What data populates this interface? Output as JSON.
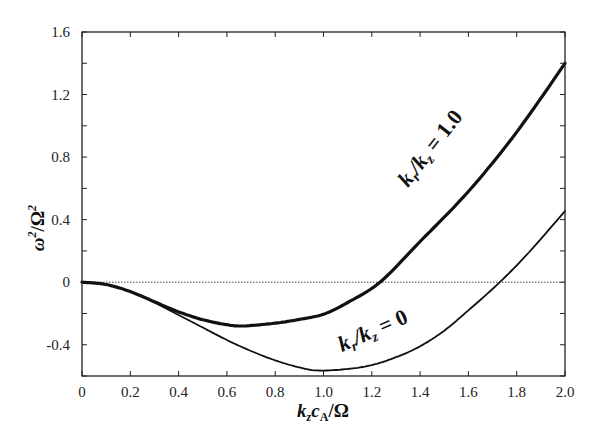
{
  "chart_data": {
    "type": "line",
    "title": "",
    "xlabel": "k_z c_A / Ω",
    "ylabel": "ω² / Ω²",
    "xlim": [
      0,
      2.0
    ],
    "ylim": [
      -0.6,
      1.6
    ],
    "grid": false,
    "legend": "none (inline curve labels)",
    "x_ticks": [
      "0",
      "0.2",
      "0.4",
      "0.6",
      "0.8",
      "1.0",
      "1.2",
      "1.4",
      "1.6",
      "1.8",
      "2.0"
    ],
    "y_ticks": [
      "-0.4",
      "0",
      "0.4",
      "0.8",
      "1.2",
      "1.6"
    ],
    "reference_line": {
      "y": 0,
      "style": "dotted"
    },
    "series": [
      {
        "name": "k_r/k_z = 1.0",
        "style": "thick",
        "x": [
          0,
          0.1,
          0.2,
          0.3,
          0.4,
          0.5,
          0.6,
          0.67,
          0.8,
          0.9,
          1.0,
          1.1,
          1.234,
          1.4,
          1.6,
          1.8,
          2.0
        ],
        "y": [
          0,
          -0.015,
          -0.06,
          -0.125,
          -0.19,
          -0.24,
          -0.272,
          -0.28,
          -0.262,
          -0.238,
          -0.205,
          -0.13,
          0,
          0.26,
          0.58,
          0.96,
          1.4
        ]
      },
      {
        "name": "k_r/k_z = 0",
        "style": "thin",
        "x": [
          0,
          0.1,
          0.2,
          0.3,
          0.4,
          0.5,
          0.6,
          0.7,
          0.8,
          0.9,
          0.98,
          1.1,
          1.2,
          1.3,
          1.4,
          1.5,
          1.6,
          1.73,
          1.85,
          2.0
        ],
        "y": [
          0,
          -0.015,
          -0.06,
          -0.13,
          -0.21,
          -0.29,
          -0.37,
          -0.44,
          -0.5,
          -0.545,
          -0.565,
          -0.555,
          -0.53,
          -0.48,
          -0.41,
          -0.31,
          -0.18,
          0,
          0.19,
          0.455
        ]
      }
    ],
    "annotations": [
      {
        "text": "k_r/k_z = 1.0",
        "near": "upper curve, rotated"
      },
      {
        "text": "k_r/k_z = 0",
        "near": "lower curve, rotated"
      }
    ]
  },
  "labels": {
    "ylabel_main": "ω",
    "ylabel_sup1": "2",
    "ylabel_slash": "/Ω",
    "ylabel_sup2": "2",
    "xlabel_k": "k",
    "xlabel_z": "z",
    "xlabel_c": "c",
    "xlabel_A": "A",
    "xlabel_rest": "/Ω",
    "curve1_k": "k",
    "curve1_r": "r",
    "curve1_mid": "/k",
    "curve1_z": "z",
    "curve1_eq": " = 1.0",
    "curve2_k": "k",
    "curve2_r": "r",
    "curve2_mid": "/k",
    "curve2_z": "z",
    "curve2_eq": " = 0"
  }
}
